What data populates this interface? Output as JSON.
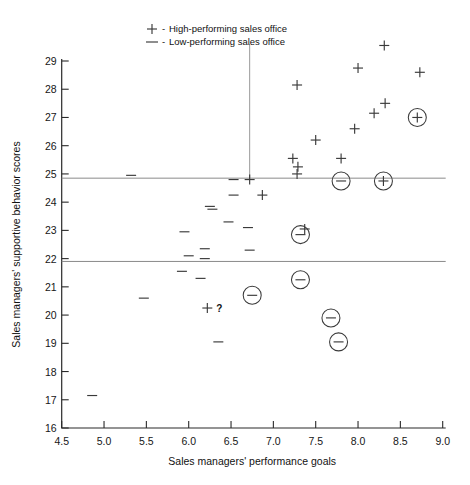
{
  "chart_data": {
    "type": "scatter",
    "title": "",
    "xlabel": "Sales managers' performance goals",
    "ylabel": "Sales managers' supportive behavior scores",
    "xlim": [
      4.5,
      9.0
    ],
    "ylim": [
      16,
      29
    ],
    "xticks": [
      "4.5",
      "5.0",
      "5.5",
      "6.0",
      "6.5",
      "7.0",
      "7.5",
      "8.0",
      "8.5",
      "9.0"
    ],
    "xtick_values": [
      4.5,
      5.0,
      5.5,
      6.0,
      6.5,
      7.0,
      7.5,
      8.0,
      8.5,
      9.0
    ],
    "yticks": [
      "16",
      "17",
      "18",
      "19",
      "20",
      "21",
      "22",
      "23",
      "24",
      "25",
      "26",
      "27",
      "28",
      "29"
    ],
    "ytick_values": [
      16,
      17,
      18,
      19,
      20,
      21,
      22,
      23,
      24,
      25,
      26,
      27,
      28,
      29
    ],
    "grid": false,
    "legend_position": "top-center",
    "legend": [
      {
        "symbol": "+",
        "dash": "-",
        "label": "High-performing sales office"
      },
      {
        "symbol": "—",
        "dash": "-",
        "label": "Low-performing sales office"
      }
    ],
    "reference_lines": [
      {
        "name": "upper-horizontal-line",
        "y": 24.85,
        "orientation": "horizontal"
      },
      {
        "name": "lower-horizontal-line",
        "y": 21.9,
        "orientation": "horizontal"
      },
      {
        "name": "vertical-divider-line",
        "x": 6.72,
        "orientation": "vertical",
        "y_from": 24.85,
        "y_to": 29.6
      }
    ],
    "series": [
      {
        "name": "High-performing sales office",
        "marker": "plus",
        "points": [
          {
            "x": 8.31,
            "y": 29.55
          },
          {
            "x": 8.0,
            "y": 28.75
          },
          {
            "x": 8.73,
            "y": 28.6
          },
          {
            "x": 7.28,
            "y": 28.15
          },
          {
            "x": 8.32,
            "y": 27.5
          },
          {
            "x": 8.19,
            "y": 27.15
          },
          {
            "x": 7.96,
            "y": 26.6
          },
          {
            "x": 7.8,
            "y": 25.55
          },
          {
            "x": 7.5,
            "y": 26.2
          },
          {
            "x": 7.29,
            "y": 25.25
          },
          {
            "x": 6.72,
            "y": 24.8
          },
          {
            "x": 7.23,
            "y": 25.55
          },
          {
            "x": 7.28,
            "y": 25.0
          },
          {
            "x": 6.87,
            "y": 24.25
          },
          {
            "x": 7.37,
            "y": 23.05
          },
          {
            "x": 6.22,
            "y": 20.25
          }
        ]
      },
      {
        "name": "Low-performing sales office",
        "marker": "minus",
        "points": [
          {
            "x": 5.32,
            "y": 24.95
          },
          {
            "x": 6.53,
            "y": 24.8
          },
          {
            "x": 6.53,
            "y": 24.25
          },
          {
            "x": 6.25,
            "y": 23.85
          },
          {
            "x": 6.47,
            "y": 23.3
          },
          {
            "x": 6.28,
            "y": 23.75
          },
          {
            "x": 6.7,
            "y": 23.1
          },
          {
            "x": 5.95,
            "y": 22.95
          },
          {
            "x": 6.0,
            "y": 22.1
          },
          {
            "x": 6.19,
            "y": 22.35
          },
          {
            "x": 6.72,
            "y": 22.3
          },
          {
            "x": 6.19,
            "y": 22.0
          },
          {
            "x": 5.92,
            "y": 21.55
          },
          {
            "x": 5.47,
            "y": 20.6
          },
          {
            "x": 6.14,
            "y": 21.3
          },
          {
            "x": 6.35,
            "y": 19.05
          },
          {
            "x": 4.86,
            "y": 17.15
          }
        ]
      },
      {
        "name": "High-performing circled (outlier)",
        "marker": "circled-plus",
        "points": [
          {
            "x": 8.7,
            "y": 27.0
          },
          {
            "x": 8.3,
            "y": 24.75
          }
        ]
      },
      {
        "name": "Low-performing circled (outlier)",
        "marker": "circled-minus",
        "points": [
          {
            "x": 7.8,
            "y": 24.75
          },
          {
            "x": 7.32,
            "y": 22.85
          },
          {
            "x": 7.32,
            "y": 21.25
          },
          {
            "x": 6.75,
            "y": 20.7
          },
          {
            "x": 7.68,
            "y": 19.9
          },
          {
            "x": 7.77,
            "y": 19.05
          }
        ]
      }
    ],
    "annotations": [
      {
        "name": "question-mark",
        "text": "?",
        "x": 6.36,
        "y": 20.25
      }
    ]
  }
}
